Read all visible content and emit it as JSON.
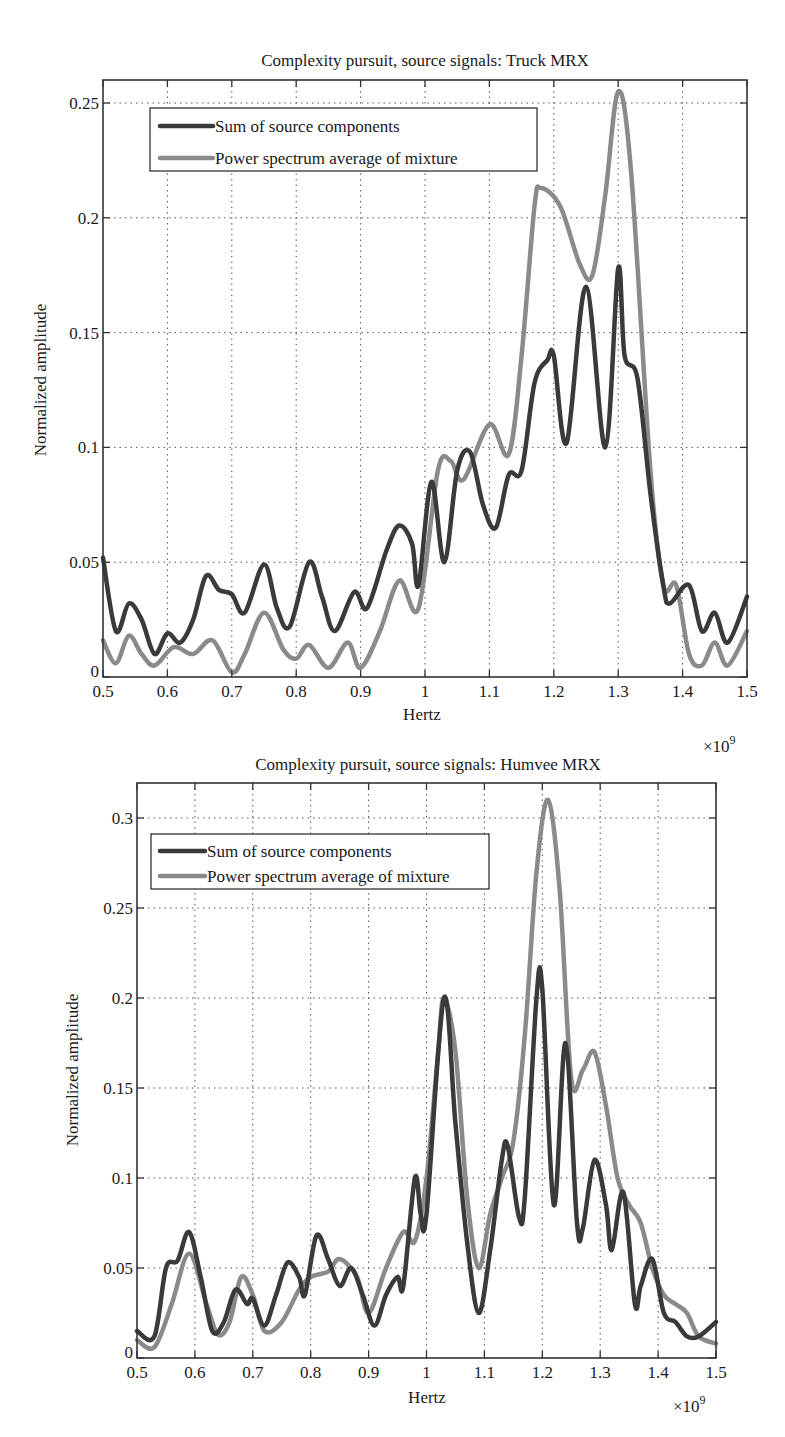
{
  "colors": {
    "sum": "#3a3a3a",
    "power": "#8a8a8a"
  },
  "chart_data": [
    {
      "type": "line",
      "title": "Complexity pursuit, source signals: Truck MRX",
      "xlabel": "Hertz",
      "ylabel": "Normalized amplitude",
      "x_multiplier_label": "×10",
      "x_multiplier_exp": "9",
      "xlim": [
        0.5,
        1.5
      ],
      "ylim": [
        0,
        0.26
      ],
      "xticks": [
        0.5,
        0.6,
        0.7,
        0.8,
        0.9,
        1.0,
        1.1,
        1.2,
        1.3,
        1.4,
        1.5
      ],
      "xtick_labels": [
        "0.5",
        "0.6",
        "0.7",
        "0.8",
        "0.9",
        "1",
        "1.1",
        "1.2",
        "1.3",
        "1.4",
        "1.5"
      ],
      "yticks": [
        0,
        0.05,
        0.1,
        0.15,
        0.2,
        0.25
      ],
      "ytick_labels": [
        "0",
        "0.05",
        "0.1",
        "0.15",
        "0.2",
        "0.25"
      ],
      "grid": true,
      "legend_position": "top-left",
      "series": [
        {
          "name": "Sum of source components",
          "color_key": "sum",
          "x": [
            0.5,
            0.52,
            0.54,
            0.56,
            0.58,
            0.6,
            0.62,
            0.64,
            0.66,
            0.68,
            0.7,
            0.72,
            0.75,
            0.77,
            0.79,
            0.82,
            0.84,
            0.86,
            0.89,
            0.91,
            0.94,
            0.96,
            0.98,
            0.99,
            1.01,
            1.03,
            1.05,
            1.07,
            1.09,
            1.11,
            1.13,
            1.15,
            1.17,
            1.19,
            1.2,
            1.22,
            1.25,
            1.28,
            1.3,
            1.31,
            1.33,
            1.35,
            1.37,
            1.38,
            1.41,
            1.43,
            1.45,
            1.47,
            1.5
          ],
          "y": [
            0.052,
            0.02,
            0.032,
            0.025,
            0.01,
            0.019,
            0.015,
            0.025,
            0.044,
            0.038,
            0.036,
            0.028,
            0.049,
            0.03,
            0.022,
            0.05,
            0.035,
            0.02,
            0.037,
            0.03,
            0.055,
            0.066,
            0.058,
            0.04,
            0.085,
            0.05,
            0.09,
            0.098,
            0.075,
            0.065,
            0.088,
            0.09,
            0.128,
            0.138,
            0.14,
            0.102,
            0.17,
            0.1,
            0.178,
            0.14,
            0.13,
            0.08,
            0.04,
            0.032,
            0.04,
            0.02,
            0.028,
            0.015,
            0.035
          ]
        },
        {
          "name": "Power spectrum average of mixture",
          "color_key": "power",
          "x": [
            0.5,
            0.52,
            0.54,
            0.56,
            0.58,
            0.61,
            0.64,
            0.67,
            0.7,
            0.72,
            0.75,
            0.78,
            0.8,
            0.82,
            0.85,
            0.88,
            0.9,
            0.93,
            0.96,
            0.99,
            1.02,
            1.04,
            1.06,
            1.1,
            1.13,
            1.15,
            1.17,
            1.18,
            1.21,
            1.24,
            1.26,
            1.28,
            1.3,
            1.32,
            1.35,
            1.37,
            1.39,
            1.41,
            1.43,
            1.45,
            1.47,
            1.5
          ],
          "y": [
            0.016,
            0.006,
            0.018,
            0.01,
            0.005,
            0.013,
            0.01,
            0.016,
            0.002,
            0.01,
            0.028,
            0.012,
            0.008,
            0.014,
            0.004,
            0.015,
            0.004,
            0.02,
            0.042,
            0.03,
            0.09,
            0.094,
            0.086,
            0.11,
            0.097,
            0.14,
            0.205,
            0.213,
            0.205,
            0.18,
            0.175,
            0.21,
            0.255,
            0.22,
            0.09,
            0.04,
            0.04,
            0.01,
            0.005,
            0.015,
            0.005,
            0.02
          ]
        }
      ]
    },
    {
      "type": "line",
      "title": "Complexity pursuit, source signals: Humvee MRX",
      "xlabel": "Hertz",
      "ylabel": "Normalized amplitude",
      "x_multiplier_label": "×10",
      "x_multiplier_exp": "9",
      "xlim": [
        0.5,
        1.5
      ],
      "ylim": [
        0,
        0.32
      ],
      "xticks": [
        0.5,
        0.6,
        0.7,
        0.8,
        0.9,
        1.0,
        1.1,
        1.2,
        1.3,
        1.4,
        1.5
      ],
      "xtick_labels": [
        "0.5",
        "0.6",
        "0.7",
        "0.8",
        "0.9",
        "1",
        "1.1",
        "1.2",
        "1.3",
        "1.4",
        "1.5"
      ],
      "yticks": [
        0,
        0.05,
        0.1,
        0.15,
        0.2,
        0.25,
        0.3
      ],
      "ytick_labels": [
        "0",
        "0.05",
        "0.1",
        "0.15",
        "0.2",
        "0.25",
        "0.3"
      ],
      "grid": true,
      "legend_position": "top-left",
      "series": [
        {
          "name": "Sum of source components",
          "color_key": "sum",
          "x": [
            0.5,
            0.53,
            0.55,
            0.57,
            0.59,
            0.61,
            0.63,
            0.65,
            0.67,
            0.69,
            0.7,
            0.72,
            0.74,
            0.76,
            0.78,
            0.79,
            0.81,
            0.83,
            0.85,
            0.87,
            0.89,
            0.91,
            0.93,
            0.95,
            0.96,
            0.98,
            0.99,
            1.0,
            1.03,
            1.05,
            1.07,
            1.09,
            1.11,
            1.13,
            1.14,
            1.16,
            1.17,
            1.19,
            1.2,
            1.22,
            1.24,
            1.26,
            1.27,
            1.29,
            1.31,
            1.32,
            1.34,
            1.36,
            1.37,
            1.39,
            1.41,
            1.43,
            1.45,
            1.47,
            1.5
          ],
          "y": [
            0.015,
            0.012,
            0.05,
            0.054,
            0.07,
            0.045,
            0.015,
            0.02,
            0.038,
            0.03,
            0.033,
            0.018,
            0.035,
            0.053,
            0.045,
            0.035,
            0.068,
            0.055,
            0.04,
            0.05,
            0.035,
            0.018,
            0.035,
            0.045,
            0.04,
            0.1,
            0.08,
            0.08,
            0.2,
            0.13,
            0.065,
            0.025,
            0.06,
            0.11,
            0.118,
            0.078,
            0.09,
            0.2,
            0.205,
            0.085,
            0.175,
            0.075,
            0.072,
            0.11,
            0.085,
            0.06,
            0.092,
            0.03,
            0.04,
            0.055,
            0.025,
            0.02,
            0.012,
            0.012,
            0.02
          ]
        },
        {
          "name": "Power spectrum average of mixture",
          "color_key": "power",
          "x": [
            0.5,
            0.53,
            0.56,
            0.59,
            0.62,
            0.64,
            0.66,
            0.68,
            0.7,
            0.72,
            0.75,
            0.78,
            0.8,
            0.83,
            0.85,
            0.88,
            0.9,
            0.93,
            0.96,
            0.98,
            1.0,
            1.02,
            1.03,
            1.05,
            1.07,
            1.09,
            1.11,
            1.13,
            1.15,
            1.17,
            1.19,
            1.21,
            1.23,
            1.25,
            1.27,
            1.29,
            1.31,
            1.33,
            1.35,
            1.37,
            1.39,
            1.41,
            1.43,
            1.45,
            1.47,
            1.5
          ],
          "y": [
            0.01,
            0.006,
            0.03,
            0.058,
            0.03,
            0.013,
            0.02,
            0.045,
            0.035,
            0.015,
            0.02,
            0.038,
            0.045,
            0.048,
            0.055,
            0.045,
            0.025,
            0.05,
            0.07,
            0.065,
            0.1,
            0.17,
            0.2,
            0.17,
            0.09,
            0.05,
            0.08,
            0.1,
            0.12,
            0.18,
            0.27,
            0.31,
            0.26,
            0.155,
            0.16,
            0.17,
            0.14,
            0.1,
            0.085,
            0.075,
            0.05,
            0.035,
            0.03,
            0.025,
            0.012,
            0.008
          ]
        }
      ]
    }
  ]
}
